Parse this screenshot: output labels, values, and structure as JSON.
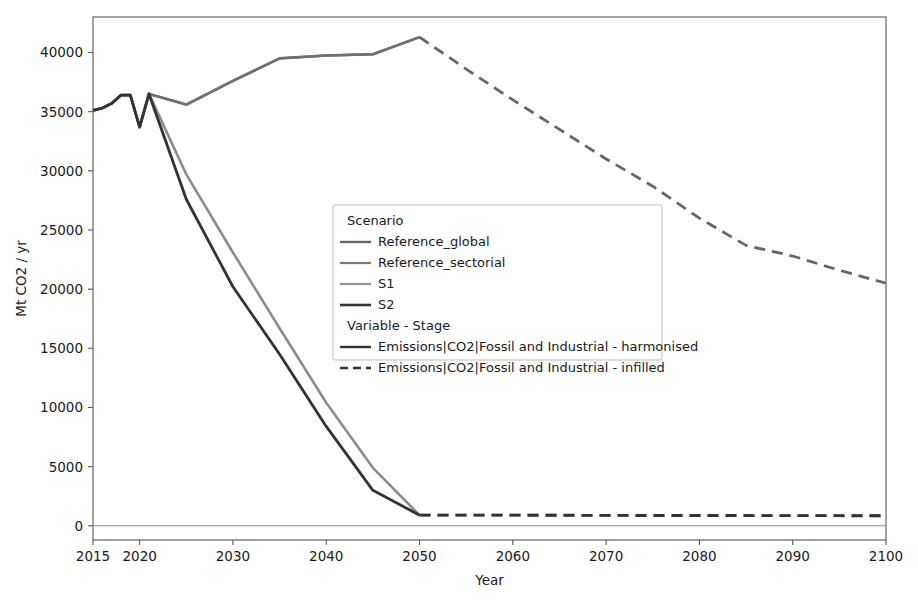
{
  "chart_data": {
    "type": "line",
    "title": "",
    "xlabel": "Year",
    "ylabel": "Mt CO2 / yr",
    "xlim": [
      2015,
      2100
    ],
    "ylim": [
      -1200,
      43000
    ],
    "grid": false,
    "legend_position": "center",
    "xticks": [
      2015,
      2020,
      2030,
      2040,
      2050,
      2060,
      2070,
      2080,
      2090,
      2100
    ],
    "xtick_labels": [
      "2015",
      "2020",
      "2030",
      "2040",
      "2050",
      "2060",
      "2070",
      "2080",
      "2090",
      "2100"
    ],
    "yticks": [
      0,
      5000,
      10000,
      15000,
      20000,
      25000,
      30000,
      35000,
      40000
    ],
    "ytick_labels": [
      "0",
      "5000",
      "10000",
      "15000",
      "20000",
      "25000",
      "30000",
      "35000",
      "40000"
    ],
    "series": [
      {
        "name": "Reference_global - harmonised",
        "scenario": "Reference_global",
        "stage": "harmonised",
        "color": "#666666",
        "width": 2.6,
        "dash": "none",
        "x": [
          2015,
          2016,
          2017,
          2018,
          2019,
          2020,
          2021,
          2025,
          2030,
          2035,
          2040,
          2045,
          2050
        ],
        "y": [
          35100,
          35300,
          35700,
          36400,
          36400,
          33700,
          36500,
          35600,
          37600,
          39500,
          39750,
          39850,
          41300
        ]
      },
      {
        "name": "Reference_global - infilled",
        "scenario": "Reference_global",
        "stage": "infilled",
        "color": "#666666",
        "width": 2.8,
        "dash": "11,7",
        "x": [
          2050,
          2055,
          2060,
          2065,
          2070,
          2075,
          2080,
          2085,
          2090,
          2095,
          2100
        ],
        "y": [
          41300,
          38600,
          36000,
          33500,
          31000,
          28700,
          26000,
          23700,
          22800,
          21600,
          20500
        ]
      },
      {
        "name": "Reference_sectorial - harmonised",
        "scenario": "Reference_sectorial",
        "stage": "harmonised",
        "color": "#707070",
        "width": 2.4,
        "dash": "none",
        "x": [
          2015,
          2016,
          2017,
          2018,
          2019,
          2020,
          2021,
          2025,
          2030,
          2035,
          2040,
          2045,
          2050
        ],
        "y": [
          35100,
          35300,
          35700,
          36400,
          36400,
          33700,
          36500,
          35600,
          37600,
          39500,
          39750,
          39850,
          41300
        ]
      },
      {
        "name": "S1 - harmonised",
        "scenario": "S1",
        "stage": "harmonised",
        "color": "#8c8c8c",
        "width": 2.6,
        "dash": "none",
        "x": [
          2015,
          2016,
          2017,
          2018,
          2019,
          2020,
          2021,
          2025,
          2030,
          2035,
          2040,
          2045,
          2050
        ],
        "y": [
          35100,
          35300,
          35700,
          36400,
          36400,
          33700,
          36500,
          29700,
          23100,
          16700,
          10400,
          4900,
          900
        ]
      },
      {
        "name": "S1 - infilled",
        "scenario": "S1",
        "stage": "infilled",
        "color": "#8c8c8c",
        "width": 2.8,
        "dash": "11,7",
        "x": [
          2050,
          2060,
          2070,
          2080,
          2090,
          2100
        ],
        "y": [
          900,
          900,
          880,
          870,
          860,
          850
        ]
      },
      {
        "name": "S2 - harmonised",
        "scenario": "S2",
        "stage": "harmonised",
        "color": "#333333",
        "width": 2.8,
        "dash": "none",
        "x": [
          2015,
          2016,
          2017,
          2018,
          2019,
          2020,
          2021,
          2025,
          2030,
          2035,
          2040,
          2045,
          2050
        ],
        "y": [
          35100,
          35300,
          35700,
          36400,
          36400,
          33700,
          36500,
          27600,
          20200,
          14500,
          8400,
          3000,
          900
        ]
      },
      {
        "name": "S2 - infilled",
        "scenario": "S2",
        "stage": "infilled",
        "color": "#333333",
        "width": 2.9,
        "dash": "11,7",
        "x": [
          2050,
          2060,
          2070,
          2080,
          2090,
          2100
        ],
        "y": [
          900,
          900,
          880,
          870,
          860,
          850
        ]
      }
    ],
    "zero_reference_line": 0,
    "annotations": []
  },
  "legend": {
    "group_title_scenario": "Scenario",
    "group_title_variable": "Variable - Stage",
    "entries_scenario": [
      {
        "label": "Reference_global",
        "color": "#666666",
        "dash": "none",
        "width": 2.4
      },
      {
        "label": "Reference_sectorial",
        "color": "#7a7a7a",
        "dash": "none",
        "width": 2.2
      },
      {
        "label": "S1",
        "color": "#949494",
        "dash": "none",
        "width": 2.2
      },
      {
        "label": "S2",
        "color": "#333333",
        "dash": "none",
        "width": 2.6
      }
    ],
    "entries_variable": [
      {
        "label": "Emissions|CO2|Fossil and Industrial - harmonised",
        "color": "#333333",
        "dash": "none",
        "width": 2.4
      },
      {
        "label": "Emissions|CO2|Fossil and Industrial - infilled",
        "color": "#333333",
        "dash": "8,5",
        "width": 2.4
      }
    ]
  },
  "layout": {
    "plot_left": 93,
    "plot_top": 17,
    "plot_right": 886,
    "plot_bottom": 540,
    "legend_x": 333,
    "legend_y": 205,
    "legend_w": 329,
    "legend_h": 155
  }
}
